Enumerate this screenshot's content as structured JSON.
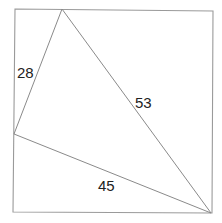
{
  "diagram": {
    "type": "geometry",
    "square": {
      "corners": [
        [
          15,
          9
        ],
        [
          213,
          11
        ],
        [
          212,
          213
        ],
        [
          13,
          212
        ]
      ]
    },
    "triangle": {
      "vertices": {
        "top": [
          62,
          9
        ],
        "left": [
          14,
          134
        ],
        "bottom_right": [
          211,
          213
        ]
      },
      "sides": [
        {
          "name": "top-left side",
          "from": "top",
          "to": "left",
          "length_label": "28"
        },
        {
          "name": "top-bottom-right side",
          "from": "top",
          "to": "bottom_right",
          "length_label": "53"
        },
        {
          "name": "left-bottom-right side",
          "from": "left",
          "to": "bottom_right",
          "length_label": "45"
        }
      ]
    },
    "labels": {
      "side_a": "28",
      "side_b": "53",
      "side_c": "45"
    },
    "colors": {
      "line": "#8a8a8a",
      "text": "#222222",
      "background": "#ffffff"
    }
  }
}
